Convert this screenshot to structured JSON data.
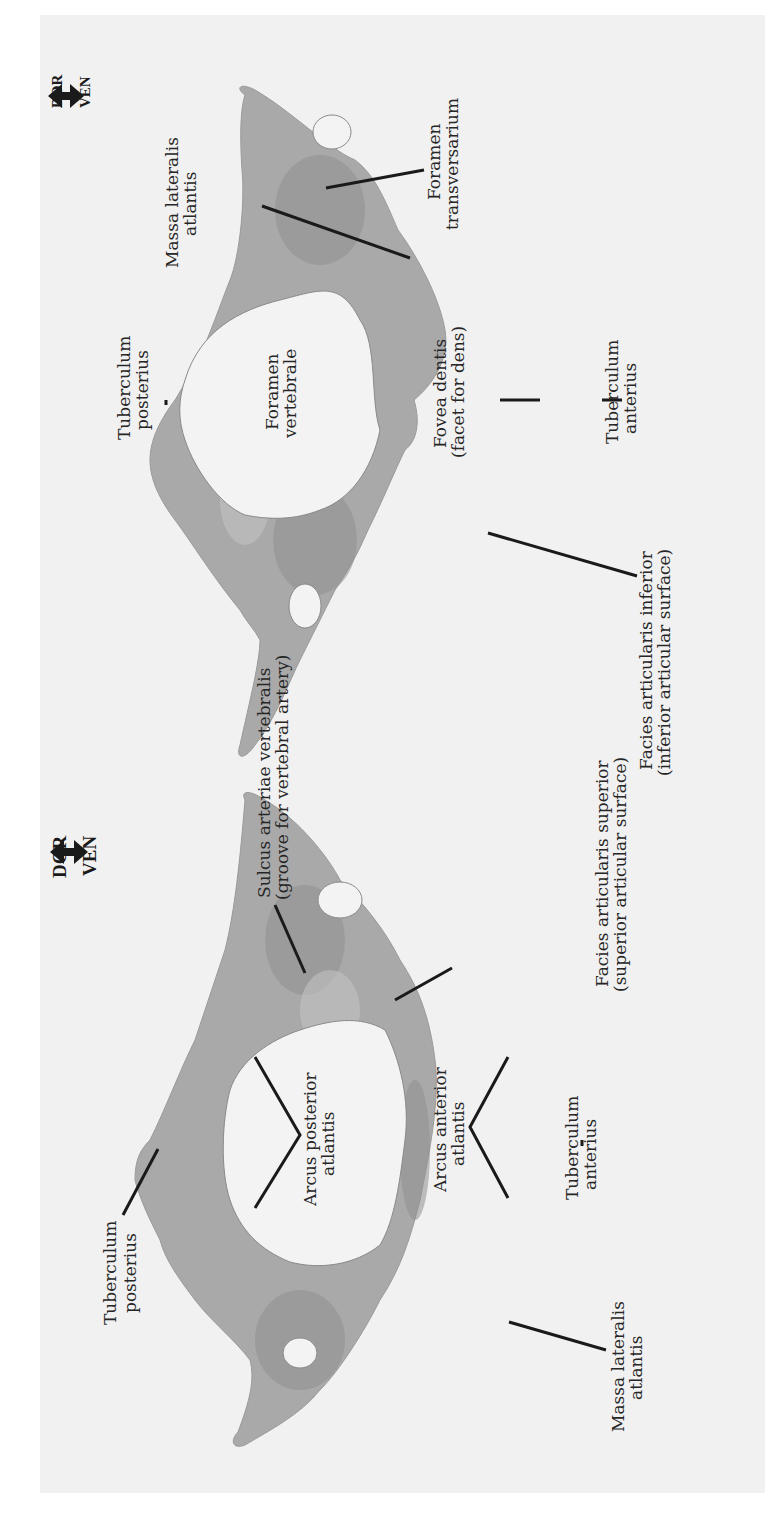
{
  "figure": {
    "orientation": "rotated -90deg (text reads bottom-to-top)",
    "background_color": "#ffffff",
    "panel_color": "#f1f1f1",
    "bone_color": "#a9a9a9"
  },
  "views": [
    {
      "id": "inferior-view",
      "position": "upper half (screen)",
      "orientation_indicator": {
        "dorsal": "DOR",
        "ventral": "VEN"
      },
      "labels": {
        "massa_lateralis_1": "Massa lateralis",
        "massa_lateralis_2": "atlantis",
        "foramen_transversarium_1": "Foramen",
        "foramen_transversarium_2": "transversarium",
        "tuberculum_posterius_1": "Tuberculum",
        "tuberculum_posterius_2": "posterius",
        "foramen_vertebrale_1": "Foramen",
        "foramen_vertebrale_2": "vertebrale",
        "fovea_dentis_1": "Fovea dentis",
        "fovea_dentis_2": "(facet for dens)",
        "tuberculum_anterius_1": "Tuberculum",
        "tuberculum_anterius_2": "anterius",
        "facies_inferior_1": "Facies articularis inferior",
        "facies_inferior_2": "(inferior articular surface)"
      }
    },
    {
      "id": "superior-view",
      "position": "lower half (screen)",
      "orientation_indicator": {
        "dorsal": "DOR",
        "ventral": "VEN"
      },
      "labels": {
        "sulcus_1": "Sulcus arteriae vertebralis",
        "sulcus_2": "(groove for vertebral artery)",
        "facies_superior_1": "Facies articularis superior",
        "facies_superior_2": "(superior articular surface)",
        "arcus_posterior_1": "Arcus posterior",
        "arcus_posterior_2": "atlantis",
        "arcus_anterior_1": "Arcus anterior",
        "arcus_anterior_2": "atlantis",
        "tuberculum_posterius_1": "Tuberculum",
        "tuberculum_posterius_2": "posterius",
        "tuberculum_anterius_1": "Tuberculum",
        "tuberculum_anterius_2": "anterius",
        "massa_lateralis_1": "Massa lateralis",
        "massa_lateralis_2": "atlantis"
      }
    }
  ]
}
